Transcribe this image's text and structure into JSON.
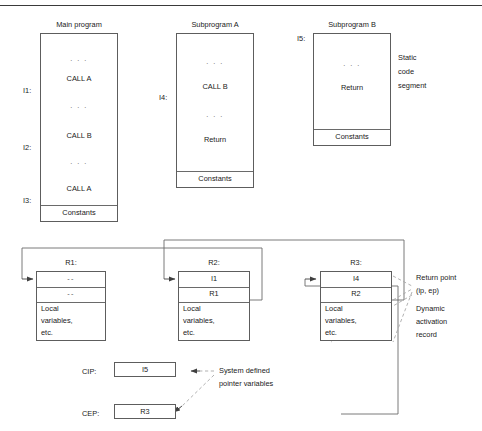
{
  "figure": {
    "title": "",
    "top_rule": true
  },
  "static_segment": {
    "annotation": [
      "Static",
      "code",
      "segment"
    ],
    "programs": [
      {
        "id": "main-program",
        "caption": "Main program",
        "side_labels": [
          "I1:",
          "I2:",
          "I3:"
        ],
        "lines": [
          ". . .",
          "CALL A",
          ". . .",
          "CALL B",
          ". . .",
          "CALL A"
        ],
        "footer": "Constants"
      },
      {
        "id": "subprogram-a",
        "caption": "Subprogram A",
        "side_labels": [
          "I4:"
        ],
        "lines": [
          ". . .",
          "CALL B",
          ". . .",
          "Return"
        ],
        "footer": "Constants"
      },
      {
        "id": "subprogram-b",
        "caption": "Subprogram B",
        "side_labels": [
          "I5:"
        ],
        "lines": [
          ". . .",
          "Return"
        ],
        "footer": "Constants"
      }
    ]
  },
  "activation_records": {
    "annotations": {
      "return_point": [
        "Return point",
        "(ip, ep)"
      ],
      "dynamic_record": [
        "Dynamic",
        "activation",
        "record"
      ]
    },
    "records": [
      {
        "id": "R1",
        "caption": "R1:",
        "slots": [
          "--",
          "--"
        ],
        "body": [
          "Local",
          "variables,",
          "etc."
        ]
      },
      {
        "id": "R2",
        "caption": "R2:",
        "slots": [
          "I1",
          "R1"
        ],
        "body": [
          "Local",
          "variables,",
          "etc."
        ]
      },
      {
        "id": "R3",
        "caption": "R3:",
        "slots": [
          "I4",
          "R2"
        ],
        "body": [
          "Local",
          "variables,",
          "etc."
        ]
      }
    ]
  },
  "pointers": {
    "annotation": [
      "System defined",
      "pointer variables"
    ],
    "variables": [
      {
        "id": "CIP",
        "label": "CIP:",
        "value": "I5"
      },
      {
        "id": "CEP",
        "label": "CEP:",
        "value": "R3"
      }
    ]
  },
  "colors": {
    "ink": "#1a1a1a",
    "stroke": "#5d5d5d",
    "dashed": "#9a9a9a",
    "rule": "#3a3a3a"
  }
}
